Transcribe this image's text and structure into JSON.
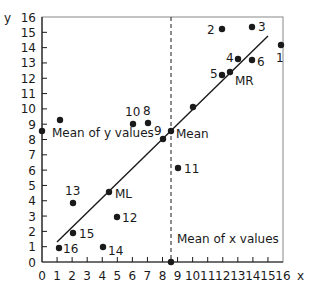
{
  "chart_data": {
    "type": "scatter",
    "title": "",
    "xlabel": "x",
    "ylabel": "y",
    "xlim": [
      0,
      16
    ],
    "ylim": [
      0,
      16
    ],
    "grid": false,
    "x_ticks": [
      "0",
      "1",
      "2",
      "3",
      "4",
      "5",
      "6",
      "7",
      "8",
      "9",
      "10",
      "11",
      "12",
      "13",
      "14",
      "15",
      "16"
    ],
    "y_ticks": [
      "0",
      "1",
      "2",
      "3",
      "4",
      "5",
      "6",
      "7",
      "8",
      "9",
      "10",
      "11",
      "12",
      "13",
      "14",
      "15",
      "16"
    ],
    "points": [
      {
        "label": "1",
        "x": 15.9,
        "y": 14.2
      },
      {
        "label": "2",
        "x": 12.0,
        "y": 15.2
      },
      {
        "label": "3",
        "x": 14.0,
        "y": 15.3
      },
      {
        "label": "4",
        "x": 13.0,
        "y": 13.3
      },
      {
        "label": "5",
        "x": 12.0,
        "y": 12.2
      },
      {
        "label": "6",
        "x": 14.0,
        "y": 13.2
      },
      {
        "label": "8",
        "x": 7.0,
        "y": 9.0
      },
      {
        "label": "9",
        "x": 8.0,
        "y": 8.0
      },
      {
        "label": "10",
        "x": 6.0,
        "y": 9.0
      },
      {
        "label": "11",
        "x": 9.0,
        "y": 6.1
      },
      {
        "label": "12",
        "x": 5.0,
        "y": 3.0
      },
      {
        "label": "13",
        "x": 2.0,
        "y": 3.9
      },
      {
        "label": "14",
        "x": 4.0,
        "y": 1.0
      },
      {
        "label": "15",
        "x": 2.0,
        "y": 2.0
      },
      {
        "label": "16",
        "x": 1.1,
        "y": 1.0
      },
      {
        "label": "",
        "x": 1.2,
        "y": 9.3
      },
      {
        "label": "",
        "x": 10.0,
        "y": 10.0
      }
    ],
    "special_points": [
      {
        "label": "Mean",
        "x": 8.56,
        "y": 8.55
      },
      {
        "label": "ML",
        "x": 4.4,
        "y": 4.6
      },
      {
        "label": "MR",
        "x": 12.5,
        "y": 12.4
      }
    ],
    "regression_line": {
      "x1": 1.0,
      "y1": 1.3,
      "x2": 15.0,
      "y2": 14.8
    },
    "mean_x": {
      "value": 8.56,
      "label": "Mean of x values"
    },
    "mean_y": {
      "value": 8.55,
      "label": "Mean of y values"
    },
    "annotations": [
      "Mean of x values",
      "Mean of y values",
      "Mean",
      "ML",
      "MR"
    ]
  },
  "labels": {
    "x_axis": "x",
    "y_axis": "y",
    "mean_x_label": "Mean of x values",
    "mean_y_label": "Mean of y values",
    "mean": "Mean",
    "ml": "ML",
    "mr": "MR",
    "p1": "1",
    "p2": "2",
    "p3": "3",
    "p4": "4",
    "p5": "5",
    "p6": "6",
    "p8": "8",
    "p9": "9",
    "p10": "10",
    "p11": "11",
    "p12": "12",
    "p13": "13",
    "p14": "14",
    "p15": "15",
    "p16": "16"
  },
  "colors": {
    "ink": "#1a1a1a",
    "frame": "#888888",
    "background": "#ffffff"
  }
}
